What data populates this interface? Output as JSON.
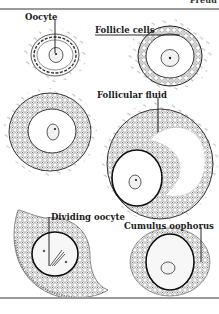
{
  "header": {
    "fragment_text": "Freud"
  },
  "figure": {
    "labels": {
      "oocyte": "Oocyte",
      "follicle_cells": "Follicle cells",
      "follicular_fluid": "Follicular fluid",
      "dividing_oocyte": "Dividing oocyte",
      "cumulus_oophorus": "Cumulus oophorus"
    },
    "panels": [
      {
        "id": "primordial-follicle",
        "label_key": "oocyte"
      },
      {
        "id": "primary-follicle",
        "label_key": "follicle_cells"
      },
      {
        "id": "secondary-follicle",
        "label_key": null
      },
      {
        "id": "antral-follicle",
        "label_key": "follicular_fluid"
      },
      {
        "id": "dividing-oocyte-follicle",
        "label_key": "dividing_oocyte"
      },
      {
        "id": "ovulated-oocyte",
        "label_key": "cumulus_oophorus"
      }
    ]
  },
  "colors": {
    "ink": "#1a1a1a",
    "rule": "#9a9a9a",
    "cell_fill": "#f3f3f3",
    "stroma": "#8c8c8c"
  }
}
